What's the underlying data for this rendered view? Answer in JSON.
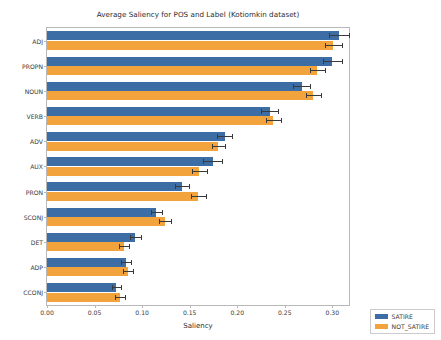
{
  "chart_data": {
    "type": "bar",
    "orientation": "horizontal",
    "title": "Average Saliency for POS and Label (Kotiomkin dataset)",
    "xlabel": "Saliency",
    "ylabel": "Part Of Speech",
    "categories": [
      "ADJ",
      "PROPN",
      "NOUN",
      "VERB",
      "ADV",
      "AUX",
      "PRON",
      "SCONJ",
      "DET",
      "ADP",
      "CCONJ"
    ],
    "series": [
      {
        "name": "SATIRE",
        "color": "#3c6ea5",
        "values": [
          0.307,
          0.3,
          0.268,
          0.234,
          0.187,
          0.174,
          0.142,
          0.115,
          0.093,
          0.083,
          0.073
        ],
        "errors": [
          0.011,
          0.01,
          0.009,
          0.009,
          0.008,
          0.01,
          0.007,
          0.006,
          0.006,
          0.005,
          0.005
        ]
      },
      {
        "name": "NOT_SATIRE",
        "color": "#f2a33c",
        "values": [
          0.301,
          0.284,
          0.28,
          0.238,
          0.18,
          0.16,
          0.159,
          0.124,
          0.081,
          0.085,
          0.077
        ],
        "errors": [
          0.009,
          0.008,
          0.008,
          0.008,
          0.007,
          0.008,
          0.008,
          0.006,
          0.005,
          0.005,
          0.005
        ]
      }
    ],
    "xlim": [
      0.0,
      0.3175
    ],
    "xticks": [
      0.0,
      0.05,
      0.1,
      0.15,
      0.2,
      0.25,
      0.3
    ],
    "xtick_labels": [
      "0.00",
      "0.05",
      "0.10",
      "0.15",
      "0.20",
      "0.25",
      "0.30"
    ],
    "grid": false,
    "legend_position": "lower right",
    "legend_entries": [
      {
        "label": "SATIRE",
        "color": "#3c6ea5"
      },
      {
        "label": "NOT_SATIRE",
        "color": "#f2a33c"
      }
    ]
  }
}
